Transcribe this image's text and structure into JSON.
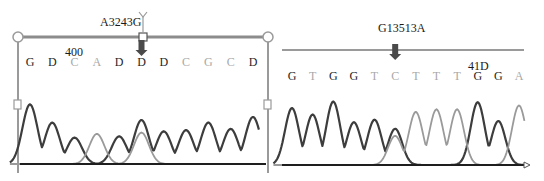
{
  "chart_data": [
    {
      "type": "line",
      "title": "A3243G",
      "mutation_label": "A3243G",
      "position_label": "400",
      "bases": [
        "G",
        "D",
        "C",
        "A",
        "D",
        "D",
        "D",
        "C",
        "G",
        "C",
        "D"
      ],
      "base_shades": [
        "dark",
        "dark",
        "light",
        "light",
        "dark",
        "dark",
        "dark",
        "light",
        "light",
        "light",
        "dark"
      ],
      "mutation_base_index": 5,
      "position_label_base_index": 2,
      "series": [
        {
          "name": "dark trace",
          "shade": "dark",
          "peaks": [
            {
              "base_index": 0,
              "height": 0.95
            },
            {
              "base_index": 1,
              "height": 0.66
            },
            {
              "base_index": 2,
              "height": 0.42
            },
            {
              "base_index": 4,
              "height": 0.44
            },
            {
              "base_index": 5,
              "height": 0.7
            },
            {
              "base_index": 6,
              "height": 0.52
            },
            {
              "base_index": 7,
              "height": 0.54
            },
            {
              "base_index": 8,
              "height": 0.66
            },
            {
              "base_index": 9,
              "height": 0.56
            },
            {
              "base_index": 10,
              "height": 0.75
            }
          ]
        },
        {
          "name": "light trace",
          "shade": "light",
          "peaks": [
            {
              "base_index": 3,
              "height": 0.48
            },
            {
              "base_index": 5,
              "height": 0.5
            }
          ]
        }
      ],
      "ylim": [
        0,
        1
      ],
      "xlabel": "",
      "ylabel": ""
    },
    {
      "type": "line",
      "title": "G13513A",
      "mutation_label": "G13513A",
      "position_label": "41D",
      "bases": [
        "G",
        "T",
        "G",
        "G",
        "T",
        "C",
        "T",
        "T",
        "T",
        "G",
        "G",
        "A"
      ],
      "base_shades": [
        "dark",
        "light",
        "dark",
        "dark",
        "light",
        "light",
        "light",
        "light",
        "light",
        "dark",
        "dark",
        "light"
      ],
      "mutation_base_index": 5,
      "position_label_base_index": 9,
      "series": [
        {
          "name": "dark trace",
          "shade": "dark",
          "peaks": [
            {
              "base_index": 0,
              "height": 0.88
            },
            {
              "base_index": 1,
              "height": 0.78
            },
            {
              "base_index": 2,
              "height": 0.98
            },
            {
              "base_index": 3,
              "height": 0.66
            },
            {
              "base_index": 4,
              "height": 0.7
            },
            {
              "base_index": 5,
              "height": 0.56
            },
            {
              "base_index": 9,
              "height": 0.97
            },
            {
              "base_index": 10,
              "height": 0.68
            }
          ]
        },
        {
          "name": "light trace",
          "shade": "light",
          "peaks": [
            {
              "base_index": 5,
              "height": 0.45
            },
            {
              "base_index": 6,
              "height": 0.82
            },
            {
              "base_index": 7,
              "height": 0.86
            },
            {
              "base_index": 8,
              "height": 0.86
            },
            {
              "base_index": 11,
              "height": 0.92
            }
          ]
        }
      ],
      "ylim": [
        0,
        1
      ],
      "xlabel": "",
      "ylabel": ""
    }
  ],
  "colors": {
    "dark": "#3d3d3d",
    "light": "#9a9a9a",
    "frame": "#8c8c8c",
    "baseline": "#1e1e1e"
  }
}
